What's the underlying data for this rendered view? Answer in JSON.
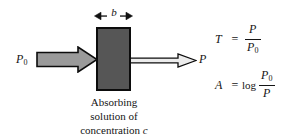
{
  "figure": {
    "background_color": "#ffffff"
  },
  "cell": {
    "name": "absorbing sample cell",
    "fill_color": "#565656",
    "border_color": "#0c0c0c"
  },
  "path_length": {
    "symbol": "b",
    "arrow": "double-headed-horizontal"
  },
  "beams": {
    "incident": {
      "label": "P",
      "subscript": "0",
      "fill_color": "#9a9a9a",
      "outline_color": "#0c0c0c",
      "direction": "right"
    },
    "transmitted": {
      "label": "P",
      "subscript": "",
      "fill_color": "#ececec",
      "outline_color": "#0c0c0c",
      "direction": "right"
    }
  },
  "caption": {
    "line1": "Absorbing",
    "line2": "solution of",
    "line3_text": "concentration",
    "line3_symbol": "c"
  },
  "equations": [
    {
      "name": "transmittance",
      "lhs": "T",
      "relation": "=",
      "function": "",
      "numerator": "P",
      "numerator_sub": "",
      "denominator": "P",
      "denominator_sub": "0"
    },
    {
      "name": "absorbance",
      "lhs": "A",
      "relation": "=",
      "function": "log",
      "numerator": "P",
      "numerator_sub": "0",
      "denominator": "P",
      "denominator_sub": ""
    }
  ]
}
